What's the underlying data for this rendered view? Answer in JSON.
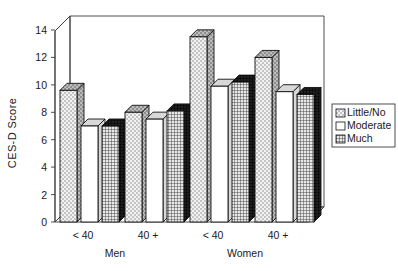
{
  "chart_data": {
    "type": "bar",
    "title": "",
    "subtitle": "",
    "xlabel": "",
    "ylabel": "CES-D Score",
    "ylim": [
      0,
      15
    ],
    "yticks": [
      0,
      2,
      4,
      6,
      8,
      10,
      12,
      14
    ],
    "ytick_labels": [
      "0",
      "2",
      "4",
      "6",
      "8",
      "10",
      "12",
      "14"
    ],
    "grid": false,
    "three_d": true,
    "legend_position": "right",
    "categories": [
      "< 40",
      "40 +",
      "< 40",
      "40 +"
    ],
    "group_labels": [
      "Men",
      "Women"
    ],
    "groups": [
      {
        "name": "Men",
        "categories": [
          "< 40",
          "40 +"
        ]
      },
      {
        "name": "Women",
        "categories": [
          "< 40",
          "40 +"
        ]
      }
    ],
    "series": [
      {
        "name": "Little/No",
        "pattern": "light-checker",
        "color": "#d9d9d9",
        "values": [
          9.6,
          8.0,
          13.5,
          12.0
        ]
      },
      {
        "name": "Moderate",
        "pattern": "solid-white",
        "color": "#ffffff",
        "values": [
          7.0,
          7.5,
          9.9,
          9.5
        ]
      },
      {
        "name": "Much",
        "pattern": "dense-grid",
        "color": "#bfbfbf",
        "values": [
          7.0,
          8.1,
          10.2,
          9.3
        ]
      }
    ],
    "legend_entries": [
      {
        "label": "Little/No",
        "pattern": "light-checker"
      },
      {
        "label": "Moderate",
        "pattern": "solid-white"
      },
      {
        "label": "Much",
        "pattern": "dense-grid"
      }
    ],
    "annotations": []
  },
  "colors": {
    "background": "#ffffff",
    "axis": "#3a3a3a",
    "bar_outline": "#111111",
    "text": "#1a1a1a",
    "series_little_no": "#d9d9d9",
    "series_moderate": "#ffffff",
    "series_much": "#bfbfbf"
  }
}
